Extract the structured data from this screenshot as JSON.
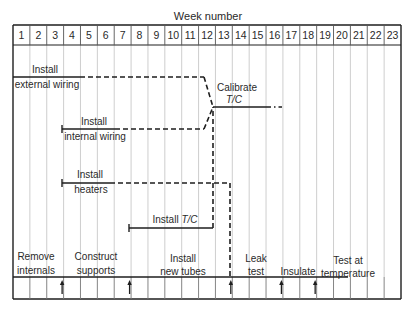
{
  "diagram": {
    "title": "Week number",
    "weeks": [
      "1",
      "2",
      "3",
      "4",
      "5",
      "6",
      "7",
      "8",
      "9",
      "10",
      "11",
      "12",
      "13",
      "14",
      "15",
      "16",
      "17",
      "18",
      "19",
      "20",
      "21",
      "22",
      "23"
    ],
    "colors": {
      "ink": "#1e1e1e",
      "grid_light": "#c8c8c8",
      "text": "#2a2a2a"
    },
    "activities": [
      {
        "id": "external-wiring",
        "label_lines": [
          "Install",
          "external wiring"
        ],
        "italic_part": null
      },
      {
        "id": "internal-wiring",
        "label_lines": [
          "Install",
          "internal wiring"
        ],
        "italic_part": null
      },
      {
        "id": "heaters",
        "label_lines": [
          "Install",
          "heaters"
        ],
        "italic_part": null
      },
      {
        "id": "install-tc",
        "label_lines": [
          "Install T/C"
        ],
        "italic_part": "T/C"
      },
      {
        "id": "calibrate-tc",
        "label_lines": [
          "Calibrate",
          "T/C"
        ],
        "italic_part": "T/C"
      }
    ],
    "timeline_phases": [
      {
        "id": "remove-internals",
        "label_lines": [
          "Remove",
          "internals"
        ]
      },
      {
        "id": "construct-supports",
        "label_lines": [
          "Construct",
          "supports"
        ]
      },
      {
        "id": "install-new-tubes",
        "label_lines": [
          "Install",
          "new tubes"
        ]
      },
      {
        "id": "leak-test",
        "label_lines": [
          "Leak",
          "test"
        ]
      },
      {
        "id": "insulate",
        "label_lines": [
          "Insulate"
        ]
      },
      {
        "id": "test-at-temperature",
        "label_lines": [
          "Test at",
          "temperature"
        ]
      }
    ],
    "milestone_week_starts": [
      4,
      8,
      14,
      17,
      19
    ],
    "timeline_end_week": 20
  }
}
